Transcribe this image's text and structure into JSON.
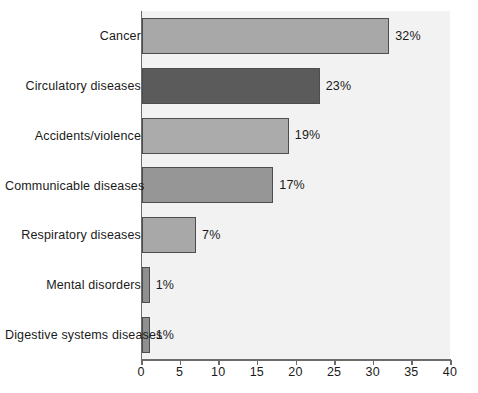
{
  "chart_data": {
    "type": "bar",
    "orientation": "horizontal",
    "title": "",
    "xlabel": "",
    "ylabel": "",
    "xlim": [
      0,
      40
    ],
    "xticks": [
      0,
      5,
      10,
      15,
      20,
      25,
      30,
      35,
      40
    ],
    "grid": false,
    "legend": null,
    "value_suffix": "%",
    "categories": [
      "Cancer",
      "Circulatory diseases",
      "Accidents/violence",
      "Communicable diseases",
      "Respiratory diseases",
      "Mental disorders",
      "Digestive systems diseases"
    ],
    "values": [
      32,
      23,
      19,
      17,
      7,
      1,
      1
    ],
    "data_labels": [
      "32%",
      "23%",
      "19%",
      "17%",
      "7%",
      "1%",
      "1%"
    ],
    "bar_colors": [
      "#a8a8a8",
      "#5b5b5b",
      "#ababab",
      "#969696",
      "#a8a8a8",
      "#8f8f8f",
      "#8f8f8f"
    ],
    "bar_edge_color": "#4d4d4d",
    "plot_background": "#f2f2f2",
    "axis_color": "#6b6b6b",
    "text_color": "#1a1a1a"
  }
}
